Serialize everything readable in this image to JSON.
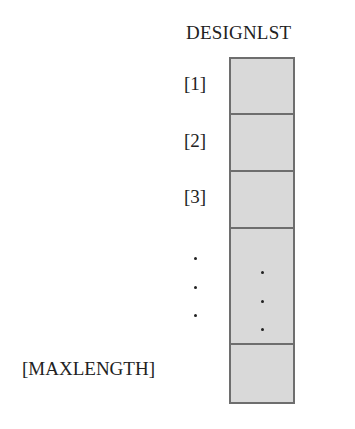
{
  "diagram": {
    "title": "DESIGNLST",
    "cells": [
      {
        "index_label": "[1]",
        "content": ""
      },
      {
        "index_label": "[2]",
        "content": ""
      },
      {
        "index_label": "[3]",
        "content": ""
      },
      {
        "index_label": "⋮",
        "content": "⋮",
        "ellipsis": true
      },
      {
        "index_label": "[MAXLENGTH]",
        "content": ""
      }
    ],
    "colors": {
      "cell_fill": "#d9d9d9",
      "cell_border": "#6e6e6e",
      "text": "#222222"
    }
  }
}
